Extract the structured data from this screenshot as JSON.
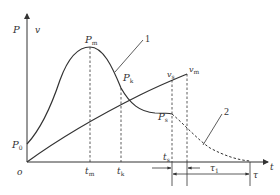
{
  "diagram": {
    "axis_labels": {
      "y_left": "P",
      "y_right": "v",
      "x": "t",
      "origin": "o"
    },
    "points": {
      "p0": {
        "base": "P",
        "sub": "0"
      },
      "pm": {
        "base": "P",
        "sub": "m"
      },
      "pk": {
        "base": "P",
        "sub": "k"
      },
      "ps": {
        "base": "P",
        "sub": "s"
      },
      "vs": {
        "base": "v",
        "sub": "s"
      },
      "vm": {
        "base": "v",
        "sub": "m"
      }
    },
    "x_ticks": {
      "tm": {
        "base": "t",
        "sub": "m"
      },
      "tk": {
        "base": "t",
        "sub": "k"
      },
      "ts": {
        "base": "t",
        "sub": "s"
      }
    },
    "intervals": {
      "tau1": {
        "base": "τ",
        "sub": "1"
      },
      "tau": {
        "base": "τ",
        "sub": ""
      }
    },
    "curve_labels": {
      "curve1": "1",
      "curve2": "2"
    },
    "colors": {
      "stroke": "#333333",
      "background": "#ffffff"
    }
  }
}
